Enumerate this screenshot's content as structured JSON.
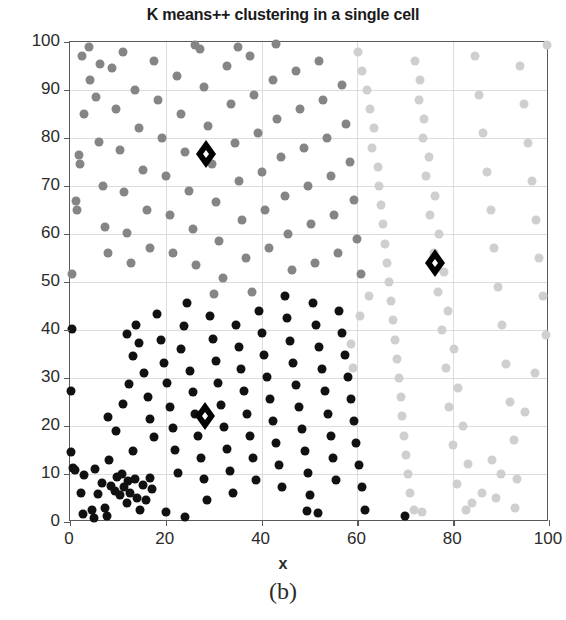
{
  "chart_data": {
    "type": "scatter",
    "title": "K means++ clustering in a single cell",
    "xlabel": "x",
    "ylabel": "y",
    "caption": "(b)",
    "xlim": [
      0,
      100
    ],
    "ylim": [
      0,
      100
    ],
    "xticks": [
      0,
      20,
      40,
      60,
      80,
      100
    ],
    "yticks": [
      0,
      10,
      20,
      30,
      40,
      50,
      60,
      70,
      80,
      90,
      100
    ],
    "grid": true,
    "legend": "none",
    "marker": "circle",
    "marker_size": 9,
    "centroid_marker": "diamond",
    "colors": {
      "cluster_dark": "#111111",
      "cluster_medium": "#858585",
      "cluster_light": "#cfcfcf",
      "centroid_fill": "#ffffff",
      "centroid_edge": "#000000",
      "axis": "#595959",
      "grid": "#dcdcdc"
    },
    "series": [
      {
        "name": "cluster-dark",
        "color": "#111111",
        "points": [
          [
            0.4,
            40.2
          ],
          [
            0.2,
            27.2
          ],
          [
            0.3,
            14.5
          ],
          [
            0.6,
            11.3
          ],
          [
            1.0,
            10.8
          ],
          [
            2.2,
            6.0
          ],
          [
            3.0,
            9.8
          ],
          [
            4.5,
            2.6
          ],
          [
            5.2,
            11.0
          ],
          [
            5.9,
            5.8
          ],
          [
            6.6,
            8.2
          ],
          [
            7.4,
            3.0
          ],
          [
            8.2,
            13.0
          ],
          [
            8.6,
            7.6
          ],
          [
            9.4,
            6.4
          ],
          [
            9.8,
            9.4
          ],
          [
            10.4,
            5.6
          ],
          [
            10.8,
            10.0
          ],
          [
            11.3,
            7.2
          ],
          [
            11.8,
            4.0
          ],
          [
            12.2,
            8.6
          ],
          [
            12.6,
            6.0
          ],
          [
            13.1,
            14.7
          ],
          [
            13.6,
            9.0
          ],
          [
            14.0,
            5.0
          ],
          [
            14.6,
            2.4
          ],
          [
            15.2,
            7.8
          ],
          [
            15.9,
            4.6
          ],
          [
            16.6,
            9.2
          ],
          [
            17.2,
            6.8
          ],
          [
            8.0,
            21.8
          ],
          [
            9.5,
            19.0
          ],
          [
            11.0,
            24.6
          ],
          [
            12.4,
            28.8
          ],
          [
            13.2,
            34.6
          ],
          [
            12.0,
            39.2
          ],
          [
            13.8,
            41.0
          ],
          [
            14.5,
            37.2
          ],
          [
            15.4,
            31.0
          ],
          [
            16.2,
            26.0
          ],
          [
            16.8,
            21.4
          ],
          [
            17.6,
            17.8
          ],
          [
            18.2,
            43.4
          ],
          [
            19.0,
            38.0
          ],
          [
            19.6,
            33.2
          ],
          [
            20.2,
            29.0
          ],
          [
            20.8,
            24.0
          ],
          [
            21.4,
            19.6
          ],
          [
            22.0,
            15.0
          ],
          [
            22.6,
            10.2
          ],
          [
            23.2,
            36.0
          ],
          [
            23.8,
            40.8
          ],
          [
            24.4,
            45.6
          ],
          [
            25.0,
            31.4
          ],
          [
            25.6,
            27.0
          ],
          [
            26.2,
            22.6
          ],
          [
            26.8,
            18.0
          ],
          [
            27.4,
            13.4
          ],
          [
            28.0,
            9.0
          ],
          [
            28.6,
            4.6
          ],
          [
            29.2,
            43.0
          ],
          [
            29.8,
            38.2
          ],
          [
            30.4,
            33.6
          ],
          [
            31.0,
            29.0
          ],
          [
            31.6,
            24.4
          ],
          [
            32.2,
            19.8
          ],
          [
            32.8,
            15.2
          ],
          [
            33.4,
            10.6
          ],
          [
            34.0,
            6.0
          ],
          [
            34.6,
            41.0
          ],
          [
            35.2,
            36.4
          ],
          [
            35.8,
            31.8
          ],
          [
            36.4,
            27.2
          ],
          [
            37.0,
            22.6
          ],
          [
            37.6,
            18.0
          ],
          [
            38.2,
            13.4
          ],
          [
            38.8,
            8.8
          ],
          [
            39.4,
            44.0
          ],
          [
            40.0,
            39.4
          ],
          [
            40.6,
            34.8
          ],
          [
            41.2,
            30.2
          ],
          [
            41.8,
            25.6
          ],
          [
            42.4,
            21.0
          ],
          [
            43.0,
            16.4
          ],
          [
            43.6,
            11.8
          ],
          [
            44.2,
            7.2
          ],
          [
            44.8,
            47.0
          ],
          [
            45.4,
            42.4
          ],
          [
            46.0,
            37.8
          ],
          [
            46.6,
            33.2
          ],
          [
            47.2,
            28.6
          ],
          [
            47.8,
            24.0
          ],
          [
            48.4,
            19.4
          ],
          [
            49.0,
            14.8
          ],
          [
            49.6,
            10.2
          ],
          [
            50.2,
            5.6
          ],
          [
            50.8,
            45.6
          ],
          [
            51.4,
            41.0
          ],
          [
            52.0,
            36.4
          ],
          [
            52.6,
            31.8
          ],
          [
            53.2,
            27.2
          ],
          [
            53.8,
            22.6
          ],
          [
            54.4,
            18.0
          ],
          [
            55.0,
            13.4
          ],
          [
            55.6,
            8.8
          ],
          [
            56.2,
            44.0
          ],
          [
            56.8,
            39.4
          ],
          [
            57.4,
            34.8
          ],
          [
            58.0,
            30.2
          ],
          [
            58.6,
            25.6
          ],
          [
            59.2,
            21.0
          ],
          [
            59.8,
            16.4
          ],
          [
            60.4,
            11.8
          ],
          [
            61.0,
            7.2
          ],
          [
            61.6,
            2.6
          ],
          [
            2.8,
            1.6
          ],
          [
            5.0,
            0.8
          ],
          [
            7.8,
            1.2
          ],
          [
            20.0,
            2.0
          ],
          [
            24.0,
            1.0
          ],
          [
            49.5,
            2.2
          ],
          [
            51.8,
            1.8
          ],
          [
            70.0,
            1.2
          ]
        ]
      },
      {
        "name": "cluster-medium",
        "color": "#858585",
        "points": [
          [
            0.5,
            51.6
          ],
          [
            1.2,
            66.8
          ],
          [
            1.4,
            65.0
          ],
          [
            1.8,
            76.4
          ],
          [
            2.0,
            74.6
          ],
          [
            3.0,
            85.0
          ],
          [
            4.2,
            92.0
          ],
          [
            5.4,
            88.6
          ],
          [
            6.0,
            79.2
          ],
          [
            6.8,
            70.0
          ],
          [
            7.4,
            61.4
          ],
          [
            8.0,
            56.0
          ],
          [
            8.8,
            94.6
          ],
          [
            9.6,
            86.0
          ],
          [
            10.4,
            77.4
          ],
          [
            11.2,
            68.8
          ],
          [
            12.0,
            60.2
          ],
          [
            12.8,
            54.0
          ],
          [
            13.6,
            90.0
          ],
          [
            14.4,
            82.0
          ],
          [
            15.2,
            73.4
          ],
          [
            16.0,
            65.0
          ],
          [
            16.8,
            57.0
          ],
          [
            17.6,
            96.0
          ],
          [
            18.4,
            88.0
          ],
          [
            19.2,
            80.0
          ],
          [
            20.0,
            72.0
          ],
          [
            20.8,
            64.0
          ],
          [
            21.6,
            56.0
          ],
          [
            22.4,
            93.0
          ],
          [
            23.2,
            85.0
          ],
          [
            24.0,
            77.0
          ],
          [
            24.8,
            69.0
          ],
          [
            25.6,
            61.0
          ],
          [
            26.4,
            53.6
          ],
          [
            27.2,
            98.6
          ],
          [
            28.0,
            90.6
          ],
          [
            28.8,
            82.6
          ],
          [
            29.6,
            74.6
          ],
          [
            30.4,
            66.6
          ],
          [
            31.2,
            58.6
          ],
          [
            32.0,
            50.8
          ],
          [
            32.8,
            95.0
          ],
          [
            33.6,
            87.0
          ],
          [
            34.4,
            79.0
          ],
          [
            35.2,
            71.0
          ],
          [
            36.0,
            63.0
          ],
          [
            36.8,
            55.0
          ],
          [
            37.6,
            97.0
          ],
          [
            38.4,
            89.0
          ],
          [
            39.2,
            81.0
          ],
          [
            40.0,
            73.0
          ],
          [
            40.8,
            65.0
          ],
          [
            41.6,
            57.0
          ],
          [
            42.4,
            92.0
          ],
          [
            43.2,
            84.0
          ],
          [
            44.0,
            76.0
          ],
          [
            44.8,
            68.0
          ],
          [
            45.6,
            60.0
          ],
          [
            46.4,
            52.4
          ],
          [
            47.2,
            94.0
          ],
          [
            48.0,
            86.0
          ],
          [
            48.8,
            78.0
          ],
          [
            49.6,
            70.0
          ],
          [
            50.4,
            62.0
          ],
          [
            51.2,
            54.0
          ],
          [
            52.0,
            96.0
          ],
          [
            52.8,
            88.0
          ],
          [
            53.6,
            80.0
          ],
          [
            54.4,
            72.0
          ],
          [
            55.2,
            64.0
          ],
          [
            56.0,
            56.0
          ],
          [
            56.8,
            91.0
          ],
          [
            57.6,
            83.0
          ],
          [
            58.4,
            75.0
          ],
          [
            59.2,
            67.0
          ],
          [
            60.0,
            59.0
          ],
          [
            60.8,
            51.6
          ],
          [
            4.0,
            99.0
          ],
          [
            11.0,
            98.0
          ],
          [
            26.0,
            99.4
          ],
          [
            35.0,
            99.0
          ],
          [
            43.0,
            99.6
          ],
          [
            2.5,
            97.0
          ],
          [
            6.2,
            95.4
          ],
          [
            30.0,
            47.5
          ],
          [
            38.0,
            48.0
          ]
        ]
      },
      {
        "name": "cluster-light",
        "color": "#cfcfcf",
        "points": [
          [
            60.2,
            98.0
          ],
          [
            62.0,
            90.0
          ],
          [
            63.4,
            82.0
          ],
          [
            64.2,
            74.0
          ],
          [
            65.0,
            66.0
          ],
          [
            65.8,
            58.0
          ],
          [
            66.6,
            50.0
          ],
          [
            67.4,
            42.0
          ],
          [
            68.2,
            34.0
          ],
          [
            69.0,
            26.0
          ],
          [
            69.8,
            18.0
          ],
          [
            70.6,
            10.0
          ],
          [
            61.0,
            94.0
          ],
          [
            62.6,
            86.0
          ],
          [
            63.0,
            78.0
          ],
          [
            64.6,
            70.0
          ],
          [
            65.4,
            62.0
          ],
          [
            66.2,
            54.0
          ],
          [
            67.0,
            46.0
          ],
          [
            67.8,
            38.0
          ],
          [
            68.6,
            30.0
          ],
          [
            69.4,
            22.0
          ],
          [
            70.2,
            14.0
          ],
          [
            71.0,
            6.0
          ],
          [
            72.0,
            96.0
          ],
          [
            72.8,
            88.0
          ],
          [
            73.6,
            80.0
          ],
          [
            74.4,
            72.0
          ],
          [
            75.2,
            64.0
          ],
          [
            76.0,
            56.0
          ],
          [
            76.8,
            48.0
          ],
          [
            77.6,
            40.0
          ],
          [
            78.4,
            32.0
          ],
          [
            79.2,
            24.0
          ],
          [
            80.0,
            16.0
          ],
          [
            80.8,
            8.0
          ],
          [
            73.0,
            92.0
          ],
          [
            74.0,
            84.0
          ],
          [
            75.0,
            76.0
          ],
          [
            76.2,
            68.0
          ],
          [
            77.0,
            60.0
          ],
          [
            78.0,
            52.0
          ],
          [
            79.0,
            44.0
          ],
          [
            80.2,
            36.0
          ],
          [
            81.0,
            28.0
          ],
          [
            82.0,
            20.0
          ],
          [
            83.0,
            12.0
          ],
          [
            84.0,
            4.0
          ],
          [
            84.6,
            97.0
          ],
          [
            85.4,
            89.0
          ],
          [
            86.2,
            81.0
          ],
          [
            87.0,
            73.0
          ],
          [
            87.8,
            65.0
          ],
          [
            88.6,
            57.0
          ],
          [
            89.4,
            49.0
          ],
          [
            90.2,
            41.0
          ],
          [
            91.0,
            33.0
          ],
          [
            91.8,
            25.0
          ],
          [
            92.6,
            17.0
          ],
          [
            93.4,
            9.0
          ],
          [
            94.0,
            95.0
          ],
          [
            94.8,
            87.0
          ],
          [
            95.6,
            79.0
          ],
          [
            96.4,
            71.0
          ],
          [
            97.2,
            63.0
          ],
          [
            98.0,
            55.0
          ],
          [
            98.8,
            47.0
          ],
          [
            99.4,
            39.0
          ],
          [
            97.0,
            31.0
          ],
          [
            95.0,
            23.0
          ],
          [
            93.0,
            3.0
          ],
          [
            99.6,
            99.4
          ],
          [
            89.0,
            5.0
          ],
          [
            86.0,
            6.0
          ],
          [
            82.6,
            2.4
          ],
          [
            59.0,
            32.0
          ],
          [
            58.6,
            37.0
          ],
          [
            60.6,
            43.0
          ],
          [
            62.4,
            47.0
          ],
          [
            71.8,
            2.6
          ],
          [
            73.4,
            2.0
          ],
          [
            88.0,
            13.0
          ],
          [
            90.0,
            10.0
          ]
        ]
      }
    ],
    "centroids": [
      {
        "label": "centroid-1",
        "x": 28.3,
        "y": 76.2
      },
      {
        "label": "centroid-2",
        "x": 76.3,
        "y": 53.6
      },
      {
        "label": "centroid-3",
        "x": 28.2,
        "y": 21.6
      }
    ]
  }
}
